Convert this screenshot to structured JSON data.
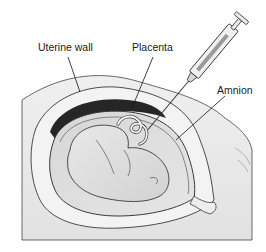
{
  "figure": {
    "labels": {
      "uterine_wall": "Uterine wall",
      "placenta": "Placenta",
      "amnion": "Amnion"
    },
    "colors": {
      "background": "#ffffff",
      "skin": "#ebebeb",
      "uterine_wall": "#f2f2f2",
      "placenta": "#2b2b2b",
      "amniotic_fluid": "#dcdcdc",
      "fetus": "#e4e4e4",
      "outline": "#3a3a3a"
    }
  }
}
